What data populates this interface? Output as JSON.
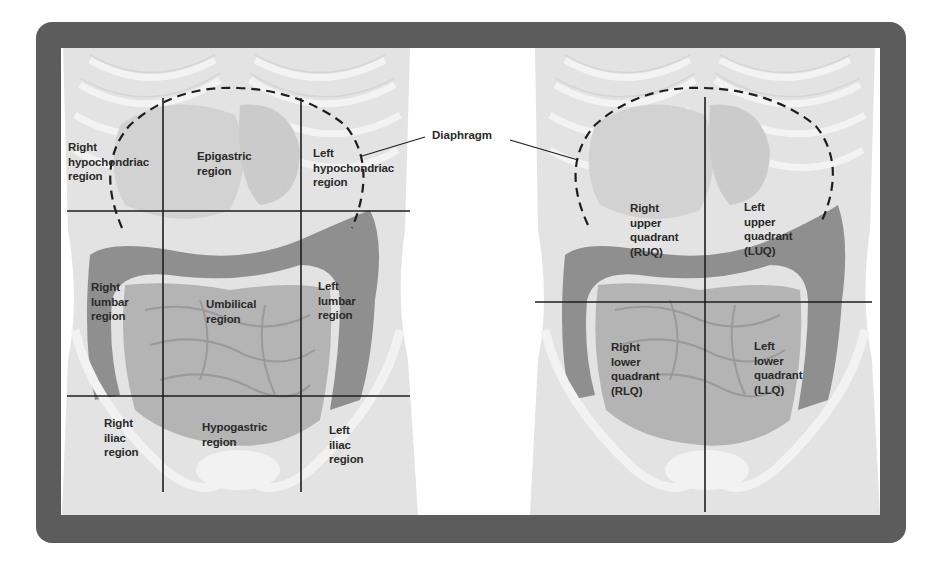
{
  "figure": {
    "callout": {
      "label": "Diaphragm"
    },
    "nine_regions": {
      "labels": [
        {
          "id": "right-hypochondriac",
          "text": "Right\nhypochondriac\nregion"
        },
        {
          "id": "epigastric",
          "text": "Epigastric\nregion"
        },
        {
          "id": "left-hypochondriac",
          "text": "Left\nhypochondriac\nregion"
        },
        {
          "id": "right-lumbar",
          "text": "Right\nlumbar\nregion"
        },
        {
          "id": "umbilical",
          "text": "Umbilical\nregion"
        },
        {
          "id": "left-lumbar",
          "text": "Left\nlumbar\nregion"
        },
        {
          "id": "right-iliac",
          "text": "Right\niliac\nregion"
        },
        {
          "id": "hypogastric",
          "text": "Hypogastric\nregion"
        },
        {
          "id": "left-iliac",
          "text": "Left\niliac\nregion"
        }
      ]
    },
    "four_quadrants": {
      "labels": [
        {
          "id": "ruq",
          "text": "Right\nupper\nquadrant\n(RUQ)"
        },
        {
          "id": "luq",
          "text": "Left\nupper\nquadrant\n(LUQ)"
        },
        {
          "id": "rlq",
          "text": "Right\nlower\nquadrant\n(RLQ)"
        },
        {
          "id": "llq",
          "text": "Left\nlower\nquadrant\n(LLQ)"
        }
      ]
    },
    "colors": {
      "frame": "#5c5c5c",
      "skin": "#e3e3e3",
      "ribs": "#f2f2f2",
      "organs": "#cfcfcf",
      "small_intestine": "#b4b4b4",
      "colon": "#8f8f8f",
      "lines": "#1e1e1e"
    }
  }
}
